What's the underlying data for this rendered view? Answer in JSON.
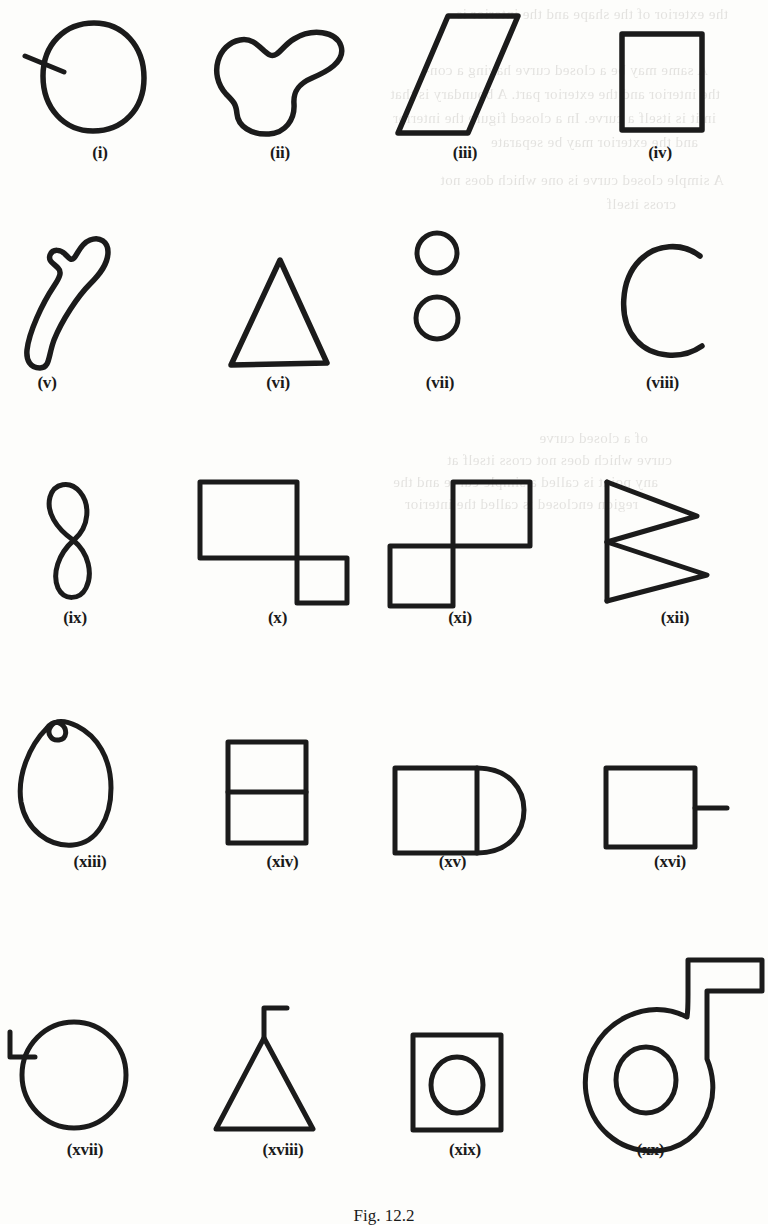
{
  "page": {
    "background_color": "#fdfdfb",
    "ink_color": "#1b1b1b",
    "caption": "Fig. 12.2"
  },
  "bleed_through_text": {
    "note": "faint show-through text from the reverse side of the printed page, mirrored and largely illegible",
    "lines": [
      "the exterior of the shape and the interior is",
      "A same may be a closed curve having a con-",
      "the interior and the exterior part. A boundary is that",
      "in it is itself a curve. In a closed figure the interior",
      "and the exterior may be separate",
      "A simple closed curve is one which does not",
      "cross itself",
      "of a closed curve",
      "curve which does not cross itself at",
      "any point is called a simple curve and the",
      "region enclosed is called the interior"
    ]
  },
  "figure": {
    "title": "Fig. 12.2",
    "shape_count": 20,
    "shapes": [
      {
        "id": "i",
        "label": "(i)",
        "description": "closed circle with a short straight stroke crossing the boundary on the left"
      },
      {
        "id": "ii",
        "label": "(ii)",
        "description": "irregular closed blob with concave lobes"
      },
      {
        "id": "iii",
        "label": "(iii)",
        "description": "slanted parallelogram"
      },
      {
        "id": "iv",
        "label": "(iv)",
        "description": "upright rectangle"
      },
      {
        "id": "v",
        "label": "(v)",
        "description": "long narrow curved open loop resembling a hook"
      },
      {
        "id": "vi",
        "label": "(vi)",
        "description": "triangle"
      },
      {
        "id": "vii",
        "label": "(vii)",
        "description": "two separate small circles, one above the other"
      },
      {
        "id": "viii",
        "label": "(viii)",
        "description": "open arc shaped like the letter C"
      },
      {
        "id": "ix",
        "label": "(ix)",
        "description": "figure-eight, curve crossing itself once"
      },
      {
        "id": "x",
        "label": "(x)",
        "description": "large square with a smaller square joined at its lower right corner"
      },
      {
        "id": "xi",
        "label": "(xi)",
        "description": "two equal squares joined corner to corner diagonally"
      },
      {
        "id": "xii",
        "label": "(xii)",
        "description": "two triangles sharing a common vertical left edge"
      },
      {
        "id": "xiii",
        "label": "(xiii)",
        "description": "closed oval with a small loop at the top"
      },
      {
        "id": "xiv",
        "label": "(xiv)",
        "description": "rectangle divided by a horizontal line into two parts"
      },
      {
        "id": "xv",
        "label": "(xv)",
        "description": "square with a semicircle attached on the right side"
      },
      {
        "id": "xvi",
        "label": "(xvi)",
        "description": "square with a short line segment sticking out of the right side"
      },
      {
        "id": "xvii",
        "label": "(xvii)",
        "description": "circle with a small L-shaped hook attached at the upper left"
      },
      {
        "id": "xviii",
        "label": "(xviii)",
        "description": "triangle with a small flag stroke at the apex"
      },
      {
        "id": "xix",
        "label": "(xix)",
        "description": "square with a circle inside it"
      },
      {
        "id": "xx",
        "label": "(xx)",
        "description": "large ring with a rectangular flag shaped projection at the upper right"
      }
    ]
  }
}
